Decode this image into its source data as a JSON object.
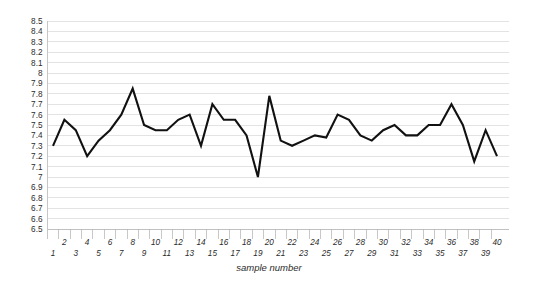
{
  "chart_data": {
    "type": "line",
    "title": "",
    "subtitle": "",
    "xlabel": "sample number",
    "ylabel": "",
    "xlim": [
      1,
      40
    ],
    "ylim": [
      6.5,
      8.5
    ],
    "ytick_step": 0.1,
    "xtick_step": 1,
    "grid": true,
    "grid_axis": "y",
    "legend": false,
    "legend_position": "none",
    "line_color": "#111111",
    "grid_color": "#d7d7d7",
    "background_color": "#ffffff",
    "x": [
      1,
      2,
      3,
      4,
      5,
      6,
      7,
      8,
      9,
      10,
      11,
      12,
      13,
      14,
      15,
      16,
      17,
      18,
      19,
      20,
      21,
      22,
      23,
      24,
      25,
      26,
      27,
      28,
      29,
      30,
      31,
      32,
      33,
      34,
      35,
      36,
      37,
      38,
      39,
      40
    ],
    "values": [
      7.3,
      7.55,
      7.45,
      7.2,
      7.35,
      7.45,
      7.6,
      7.85,
      7.5,
      7.45,
      7.45,
      7.55,
      7.6,
      7.3,
      7.7,
      7.55,
      7.55,
      7.4,
      7.0,
      7.78,
      7.35,
      7.3,
      7.35,
      7.4,
      7.38,
      7.6,
      7.55,
      7.4,
      7.35,
      7.45,
      7.5,
      7.4,
      7.4,
      7.5,
      7.5,
      7.7,
      7.5,
      7.15,
      7.45,
      7.2
    ],
    "ytick_labels": [
      "8.5",
      "8.4",
      "8.3",
      "8.2",
      "8.1",
      "8",
      "7.9",
      "7.8",
      "7.7",
      "7.6",
      "7.5",
      "7.4",
      "7.3",
      "7.2",
      "7.1",
      "7",
      "6.9",
      "6.8",
      "6.7",
      "6.6",
      "6.5"
    ],
    "ytick_values": [
      8.5,
      8.4,
      8.3,
      8.2,
      8.1,
      8.0,
      7.9,
      7.8,
      7.7,
      7.6,
      7.5,
      7.4,
      7.3,
      7.2,
      7.1,
      7.0,
      6.9,
      6.8,
      6.7,
      6.6,
      6.5
    ],
    "xtick_labels": [
      "1",
      "2",
      "3",
      "4",
      "5",
      "6",
      "7",
      "8",
      "9",
      "10",
      "11",
      "12",
      "13",
      "14",
      "15",
      "16",
      "17",
      "18",
      "19",
      "20",
      "21",
      "22",
      "23",
      "24",
      "25",
      "26",
      "27",
      "28",
      "29",
      "30",
      "31",
      "32",
      "33",
      "34",
      "35",
      "36",
      "37",
      "38",
      "39",
      "40"
    ]
  }
}
